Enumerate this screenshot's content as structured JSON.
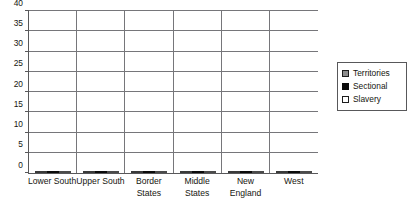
{
  "chart_data": {
    "type": "bar",
    "title": "",
    "subtitle": "",
    "xlabel": "",
    "ylabel": "",
    "ylim": [
      0,
      40
    ],
    "yticks": [
      0,
      5,
      10,
      15,
      20,
      25,
      30,
      35,
      40
    ],
    "grid": true,
    "grid_axis": "y",
    "legend_position": "right",
    "categories": [
      "Lower South",
      "Upper South",
      "Border States",
      "Middle States",
      "New England",
      "West"
    ],
    "category_lines": [
      [
        "Lower South"
      ],
      [
        "Upper South"
      ],
      [
        "Border",
        "States"
      ],
      [
        "Middle",
        "States"
      ],
      [
        "New England"
      ],
      [
        "West"
      ]
    ],
    "series": [
      {
        "name": "Territories",
        "color": "#8d8d8d",
        "values": [
          7,
          36,
          10,
          26,
          14,
          7
        ]
      },
      {
        "name": "Sectional",
        "color": "#0b0b0b",
        "values": [
          23,
          18,
          14,
          14,
          14,
          18
        ]
      },
      {
        "name": "Slavery",
        "color": "#ffffff",
        "values": [
          17,
          38,
          17,
          7,
          7,
          13
        ]
      }
    ],
    "legend": [
      {
        "label": "Territories",
        "swatch": "territories"
      },
      {
        "label": "Sectional",
        "swatch": "sectional"
      },
      {
        "label": "Slavery",
        "swatch": "slavery"
      }
    ]
  },
  "colors": {
    "axis": "#58585a",
    "gridline": "#76767a",
    "text": "#16160f",
    "territories": "#8d8d8d",
    "sectional": "#0b0b0b",
    "slavery": "#ffffff",
    "background": "#ffffff"
  }
}
